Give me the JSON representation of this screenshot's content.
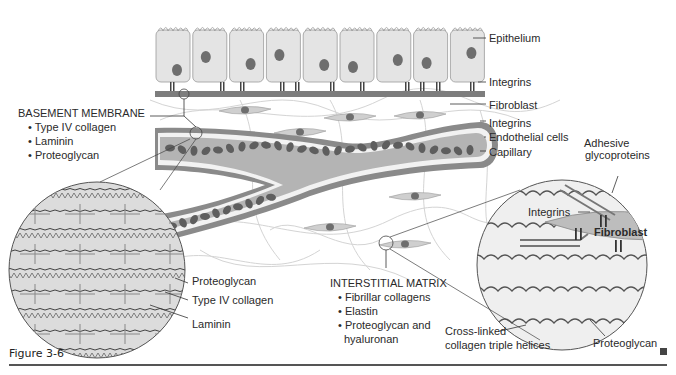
{
  "figure": {
    "caption": "Figure 3-6",
    "end_marker": "square-marker"
  },
  "basement_membrane": {
    "title": "BASEMENT MEMBRANE",
    "items": [
      "• Type IV collagen",
      "• Laminin",
      "• Proteoglycan"
    ],
    "inset_labels": [
      "Proteoglycan",
      "Type IV collagen",
      "Laminin"
    ]
  },
  "right_labels": [
    "Epithelium",
    "Integrins",
    "Fibroblast",
    "Integrins",
    "Endothelial cells",
    "Capillary"
  ],
  "interstitial_matrix": {
    "title": "INTERSTITIAL MATRIX",
    "items": [
      "• Fibrillar collagens",
      "• Elastin",
      "• Proteoglycan and",
      "hyaluronan"
    ]
  },
  "right_inset": {
    "adhesive": [
      "Adhesive",
      "glycoproteins"
    ],
    "integrins": "Integrins",
    "fibroblast": "Fibroblast",
    "crosslinked": [
      "Cross-linked",
      "collagen triple helices"
    ],
    "proteoglycan": "Proteoglycan"
  },
  "colors": {
    "cell_fill": "#e4e4e4",
    "nucleus": "#6e6e6e",
    "membrane": "#7a7a7a",
    "vessel_wall": "#8c8c8c",
    "blood_cell": "#5e5e5e",
    "inset_fill": "#d9d9d9"
  }
}
